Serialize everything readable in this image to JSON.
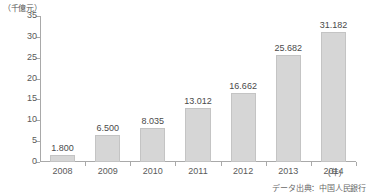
{
  "chart_data": {
    "type": "bar",
    "title": "",
    "xlabel": "(年)",
    "ylabel": "(千億元)",
    "unit_label": "（千億元）",
    "x_unit_label": "(年)",
    "categories": [
      "2008",
      "2009",
      "2010",
      "2011",
      "2012",
      "2013",
      "2014"
    ],
    "values": [
      1.8,
      6.5,
      8.035,
      13.012,
      16.662,
      25.682,
      31.182
    ],
    "data_labels": [
      "1.800",
      "6.500",
      "8.035",
      "13.012",
      "16.662",
      "25.682",
      "31.182"
    ],
    "ylim": [
      0,
      35
    ],
    "yticks": [
      0,
      5,
      10,
      15,
      20,
      25,
      30,
      35
    ],
    "ytick_labels": [
      "0",
      "5",
      "10",
      "15",
      "20",
      "25",
      "30",
      "35"
    ],
    "grid": false,
    "legend": false,
    "series": [
      {
        "name": "",
        "values": [
          1.8,
          6.5,
          8.035,
          13.012,
          16.662,
          25.682,
          31.182
        ]
      }
    ],
    "bar_color": "#d6d6d6",
    "bar_border_color": "#c4c4c4",
    "axis_color": "#a9a9a9",
    "text_color": "#5a5a5a"
  },
  "source": {
    "note": "データ出典：中国人民銀行"
  }
}
